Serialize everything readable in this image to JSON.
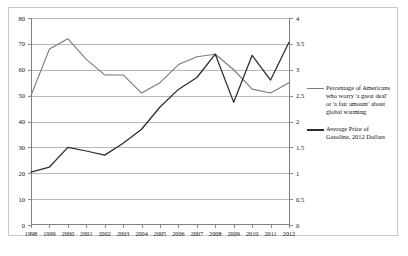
{
  "chart_data": {
    "type": "line",
    "title": "",
    "xlabel": "",
    "ylabel": "",
    "grid": true,
    "legend_position": "right",
    "categories": [
      "1998",
      "1999",
      "2000",
      "2001",
      "2002",
      "2003",
      "2004",
      "2005",
      "2006",
      "2007",
      "2008",
      "2009",
      "2010",
      "2011",
      "2012"
    ],
    "axes": {
      "x": {
        "ticks": [
          "1998",
          "1999",
          "2000",
          "2001",
          "2002",
          "2003",
          "2004",
          "2005",
          "2006",
          "2007",
          "2008",
          "2009",
          "2010",
          "2011",
          "2012"
        ]
      },
      "y_left": {
        "ticks": [
          "0",
          "10",
          "20",
          "30",
          "40",
          "50",
          "60",
          "70",
          "80"
        ],
        "min": 0,
        "max": 80,
        "step": 10
      },
      "y_right": {
        "ticks": [
          "0",
          "0.5",
          "1",
          "1.5",
          "2",
          "2.5",
          "3",
          "3.5",
          "4"
        ],
        "min": 0,
        "max": 4,
        "step": 0.5
      }
    },
    "series": [
      {
        "name": "Percentage of Americans who worry 'a great deal' or 'a fair amount' about global warming",
        "axis": "y_left",
        "color": "#7a7a7a",
        "values": [
          50,
          68,
          72,
          64,
          58,
          58,
          51,
          55,
          62,
          65,
          66,
          60,
          52.5,
          51,
          55
        ]
      },
      {
        "name": "Average Price of Gasoline, 2012 Dollars",
        "axis": "y_right",
        "color": "#2b2b2b",
        "values": [
          1.02,
          1.12,
          1.5,
          1.43,
          1.35,
          1.58,
          1.85,
          2.28,
          2.62,
          2.85,
          3.3,
          2.37,
          3.28,
          2.8,
          3.53
        ]
      }
    ]
  },
  "legend": {
    "entries": [
      {
        "label": "Percentage of Americans who worry 'a great deal' or 'a fair amount' about global warming",
        "color": "#7a7a7a"
      },
      {
        "label": "Average Price of Gasoline, 2012 Dollars",
        "color": "#2b2b2b"
      }
    ]
  }
}
